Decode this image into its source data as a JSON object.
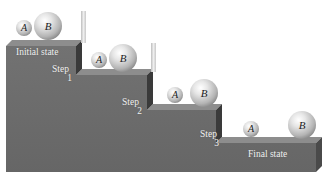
{
  "diagram": {
    "states": {
      "initial": "Initial state",
      "final": "Final state"
    },
    "steps": [
      {
        "label": "Step",
        "number": "1"
      },
      {
        "label": "Step",
        "number": "2"
      },
      {
        "label": "Step",
        "number": "3"
      }
    ],
    "balls": {
      "a": "A",
      "b": "B"
    },
    "colors": {
      "step_front": "#6b6b6b",
      "step_top": "#8a8a8a",
      "step_side": "#3c3c3c",
      "ball_highlight": "#f4f4f4",
      "ball_shadow": "#9a9a9a",
      "barrier": "#d8d8d8",
      "label_text": "#f2f2f2"
    }
  }
}
